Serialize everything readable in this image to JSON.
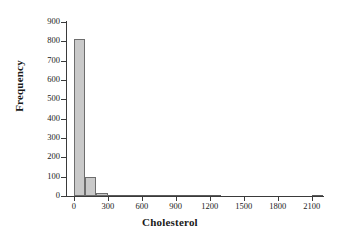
{
  "chart_data": {
    "type": "bar",
    "title": "",
    "subtitle": "",
    "xlabel": "Cholesterol",
    "ylabel": "Frequency",
    "xlim": [
      -60,
      2200
    ],
    "ylim": [
      0,
      900
    ],
    "grid": false,
    "legend": null,
    "bin_width": 100,
    "x_ticks": [
      0,
      300,
      600,
      900,
      1200,
      1500,
      1800,
      2100
    ],
    "x_tick_labels": [
      "0",
      "300",
      "600",
      "900",
      "1200",
      "1500",
      "1800",
      "2100"
    ],
    "y_ticks": [
      0,
      100,
      200,
      300,
      400,
      500,
      600,
      700,
      800,
      900
    ],
    "y_tick_labels": [
      "0",
      "100",
      "200",
      "300",
      "400",
      "500",
      "600",
      "700",
      "800",
      "900"
    ],
    "bin_starts": [
      0,
      100,
      200,
      300,
      400,
      500,
      600,
      700,
      800,
      900,
      1000,
      1100,
      1200,
      1300,
      1400,
      1500,
      1600,
      1700,
      1800,
      1900,
      2000,
      2100
    ],
    "values": [
      810,
      100,
      18,
      4,
      3,
      3,
      6,
      4,
      2,
      2,
      2,
      2,
      2,
      0,
      0,
      0,
      0,
      0,
      0,
      0,
      0,
      4
    ],
    "categories": [
      "0-100",
      "100-200",
      "200-300",
      "300-400",
      "400-500",
      "500-600",
      "600-700",
      "700-800",
      "800-900",
      "900-1000",
      "1000-1100",
      "1100-1200",
      "1200-1300",
      "1300-1400",
      "1400-1500",
      "1500-1600",
      "1600-1700",
      "1700-1800",
      "1800-1900",
      "1900-2000",
      "2000-2100",
      "2100-2200"
    ],
    "colors": {
      "bar_fill": "#c9c9c9",
      "bar_edge": "#6d6d6d",
      "axis": "#3a3a3a",
      "text": "#1a1a1a",
      "background": "#ffffff"
    }
  }
}
